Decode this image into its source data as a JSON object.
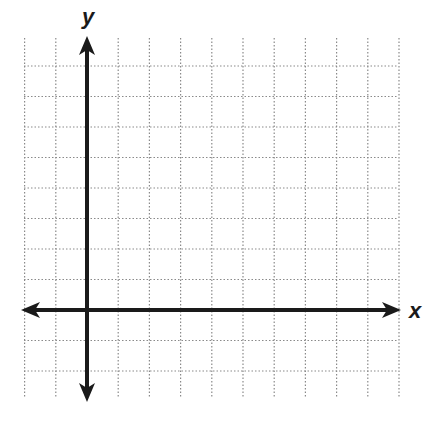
{
  "diagram": {
    "type": "coordinate-plane",
    "axes": {
      "x_label": "x",
      "y_label": "y",
      "arrows": [
        "left",
        "right",
        "up",
        "down"
      ]
    },
    "grid": {
      "style": "dotted",
      "columns_left_of_y_axis": 2,
      "columns_right_of_y_axis": 10,
      "rows_above_x_axis": 9,
      "rows_below_x_axis": 3
    },
    "colors": {
      "axis": "#1a1a1a",
      "grid": "#8a8a8a",
      "background": "#ffffff"
    }
  }
}
